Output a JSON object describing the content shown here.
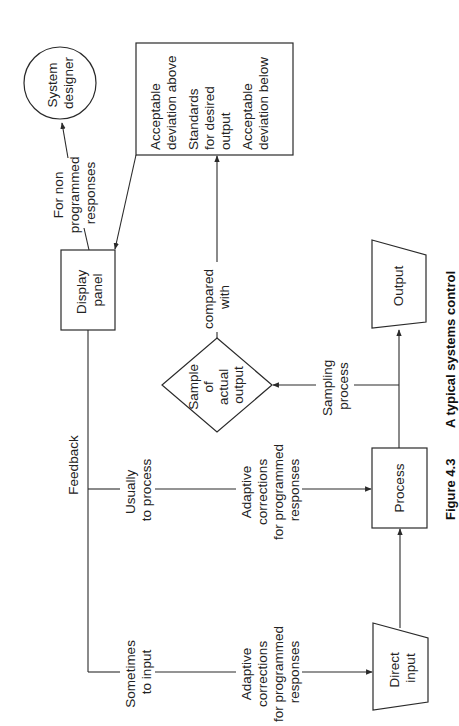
{
  "figure": {
    "caption_number": "Figure 4.3",
    "caption_title": "A typical systems control",
    "orientation": "rotated 90° counter-clockwise"
  },
  "nodes": {
    "system_designer": {
      "lines": [
        "System",
        "designer"
      ],
      "shape": "circle"
    },
    "standards": {
      "shape": "rectangle",
      "lines": [
        "Acceptable",
        "deviation above",
        "Standards",
        "for desired",
        "output",
        "Acceptable",
        "deviation below"
      ]
    },
    "display_panel": {
      "lines": [
        "Display",
        "panel"
      ],
      "shape": "rectangle"
    },
    "sample": {
      "lines": [
        "Sample",
        "of",
        "actual",
        "output"
      ],
      "shape": "diamond"
    },
    "output": {
      "lines": [
        "Output"
      ],
      "shape": "trapezoid"
    },
    "process": {
      "lines": [
        "Process"
      ],
      "shape": "rectangle"
    },
    "direct_input": {
      "lines": [
        "Direct",
        "input"
      ],
      "shape": "trapezoid"
    }
  },
  "edge_labels": {
    "non_programmed": [
      "For non",
      "programmed",
      "responses"
    ],
    "compared_with": [
      "compared",
      "with"
    ],
    "feedback": [
      "Feedback"
    ],
    "usually_to_process": [
      "Usually",
      "to process"
    ],
    "sometimes_to_input": [
      "Sometimes",
      "to input"
    ],
    "adaptive_process": [
      "Adaptive",
      "corrections",
      "for programmed",
      "responses"
    ],
    "adaptive_input": [
      "Adaptive",
      "corrections",
      "for programmed",
      "responses"
    ],
    "sampling_process": [
      "Sampling",
      "process"
    ]
  },
  "colors": {
    "stroke": "#2a2a2a",
    "text": "#222222",
    "background": "#ffffff"
  }
}
